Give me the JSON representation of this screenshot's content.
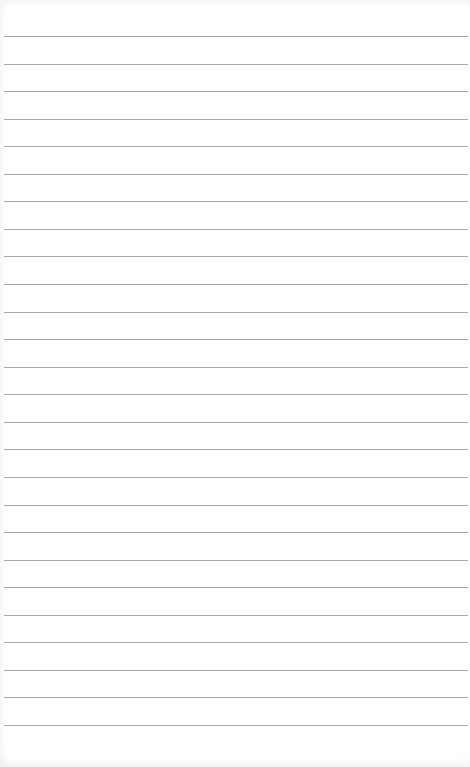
{
  "notepad": {
    "line_count": 26,
    "first_line_y": 36,
    "line_spacing": 27.56,
    "line_color": "#a9a9a9",
    "paper_color": "#ffffff",
    "lines_text": [
      "",
      "",
      "",
      "",
      "",
      "",
      "",
      "",
      "",
      "",
      "",
      "",
      "",
      "",
      "",
      "",
      "",
      "",
      "",
      "",
      "",
      "",
      "",
      "",
      "",
      ""
    ]
  }
}
